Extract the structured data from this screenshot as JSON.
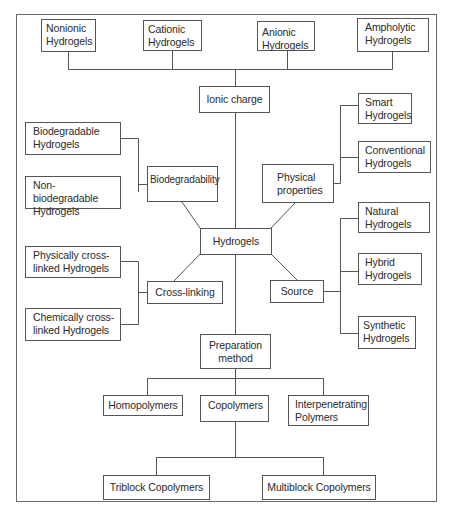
{
  "diagram": {
    "type": "classification-tree",
    "root": "Hydrogels",
    "colors": {
      "line": "#555555",
      "box_border": "#555555",
      "background": "#ffffff",
      "text": "#2a2a2a"
    },
    "categories": {
      "ionic_charge": {
        "label": "Ionic charge",
        "children": [
          {
            "label": "Nonionic\nHydrogels"
          },
          {
            "label": "Cationic\nHydrogels"
          },
          {
            "label": "Anionic\nHydrogels"
          },
          {
            "label": "Ampholytic\nHydrogels"
          }
        ]
      },
      "biodegradability": {
        "label": "Biodegradability",
        "children": [
          {
            "label": "Biodegradable\nHydrogels"
          },
          {
            "label": "Non-biodegradable\nHydrogels"
          }
        ]
      },
      "physical_properties": {
        "label": "Physical\nproperties",
        "children": [
          {
            "label": "Smart\nHydrogels"
          },
          {
            "label": "Conventional\nHydrogels"
          }
        ]
      },
      "cross_linking": {
        "label": "Cross-linking",
        "children": [
          {
            "label": "Physically cross-\nlinked Hydrogels"
          },
          {
            "label": "Chemically cross-\nlinked Hydrogels"
          }
        ]
      },
      "source": {
        "label": "Source",
        "children": [
          {
            "label": "Natural\nHydrogels"
          },
          {
            "label": "Hybrid\nHydrogels"
          },
          {
            "label": "Synthetic\nHydrogels"
          }
        ]
      },
      "preparation_method": {
        "label": "Preparation\nmethod",
        "children": [
          {
            "label": "Homopolymers"
          },
          {
            "label": "Copolymers",
            "children": [
              {
                "label": "Triblock Copolymers"
              },
              {
                "label": "Multiblock Copolymers"
              }
            ]
          },
          {
            "label": "Interpenetrating\nPolymers"
          }
        ]
      }
    }
  }
}
